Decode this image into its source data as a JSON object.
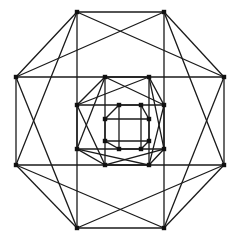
{
  "figure": {
    "kind": "line-drawing",
    "background_color": "#ffffff",
    "edge_color": "#1a1a1a",
    "vertex_color": "#111111",
    "edge_width": 1.3,
    "vertex_size": 4.4,
    "canvas": {
      "width": 233,
      "height": 241
    }
  },
  "chart_data": {
    "type": "diagram",
    "grid": false,
    "legend": null,
    "xlim": [
      0,
      233
    ],
    "ylim": [
      0,
      241
    ],
    "vertices": [
      {
        "id": "o-n-w",
        "x": 77,
        "y": 12
      },
      {
        "id": "o-n-e",
        "x": 164,
        "y": 12
      },
      {
        "id": "o-e-n",
        "x": 224,
        "y": 77
      },
      {
        "id": "o-e-s",
        "x": 224,
        "y": 165
      },
      {
        "id": "o-s-e",
        "x": 164,
        "y": 228
      },
      {
        "id": "o-s-w",
        "x": 77,
        "y": 228
      },
      {
        "id": "o-w-s",
        "x": 16,
        "y": 165
      },
      {
        "id": "o-w-n",
        "x": 16,
        "y": 77
      },
      {
        "id": "m-n-w",
        "x": 105,
        "y": 77
      },
      {
        "id": "m-n-e",
        "x": 149,
        "y": 77
      },
      {
        "id": "m-e-n",
        "x": 164,
        "y": 105
      },
      {
        "id": "m-e-s",
        "x": 164,
        "y": 149
      },
      {
        "id": "m-s-e",
        "x": 149,
        "y": 165
      },
      {
        "id": "m-s-w",
        "x": 105,
        "y": 165
      },
      {
        "id": "m-w-s",
        "x": 77,
        "y": 149
      },
      {
        "id": "m-w-n",
        "x": 77,
        "y": 105
      },
      {
        "id": "i-n-w",
        "x": 119,
        "y": 105
      },
      {
        "id": "i-n-e",
        "x": 141,
        "y": 105
      },
      {
        "id": "i-e-n",
        "x": 149,
        "y": 119
      },
      {
        "id": "i-e-s",
        "x": 149,
        "y": 141
      },
      {
        "id": "i-s-e",
        "x": 141,
        "y": 149
      },
      {
        "id": "i-s-w",
        "x": 119,
        "y": 149
      },
      {
        "id": "i-w-s",
        "x": 105,
        "y": 141
      },
      {
        "id": "i-w-n",
        "x": 105,
        "y": 119
      }
    ],
    "edges": [
      [
        "o-n-w",
        "o-n-e"
      ],
      [
        "o-n-e",
        "o-e-n"
      ],
      [
        "o-e-n",
        "o-e-s"
      ],
      [
        "o-e-s",
        "o-s-e"
      ],
      [
        "o-s-e",
        "o-s-w"
      ],
      [
        "o-s-w",
        "o-w-s"
      ],
      [
        "o-w-s",
        "o-w-n"
      ],
      [
        "o-w-n",
        "o-n-w"
      ],
      [
        "o-n-w",
        "o-s-w"
      ],
      [
        "o-n-e",
        "o-s-e"
      ],
      [
        "o-w-n",
        "o-e-n"
      ],
      [
        "o-w-s",
        "o-e-s"
      ],
      [
        "o-w-n",
        "o-n-e"
      ],
      [
        "o-n-e",
        "o-e-s"
      ],
      [
        "o-e-s",
        "o-s-w"
      ],
      [
        "o-s-w",
        "o-w-n"
      ],
      [
        "o-n-w",
        "o-e-n"
      ],
      [
        "o-e-n",
        "o-s-e"
      ],
      [
        "o-s-e",
        "o-w-s"
      ],
      [
        "o-w-s",
        "o-n-w"
      ],
      [
        "m-n-w",
        "m-n-e"
      ],
      [
        "m-n-e",
        "m-e-n"
      ],
      [
        "m-e-n",
        "m-e-s"
      ],
      [
        "m-e-s",
        "m-s-e"
      ],
      [
        "m-s-e",
        "m-s-w"
      ],
      [
        "m-s-w",
        "m-w-s"
      ],
      [
        "m-w-s",
        "m-w-n"
      ],
      [
        "m-w-n",
        "m-n-w"
      ],
      [
        "m-n-w",
        "m-s-w"
      ],
      [
        "m-n-e",
        "m-s-e"
      ],
      [
        "m-w-n",
        "m-e-n"
      ],
      [
        "m-w-s",
        "m-e-s"
      ],
      [
        "m-w-n",
        "m-n-e"
      ],
      [
        "m-n-e",
        "m-e-s"
      ],
      [
        "m-e-s",
        "m-s-w"
      ],
      [
        "m-s-w",
        "m-w-n"
      ],
      [
        "m-n-w",
        "m-e-n"
      ],
      [
        "m-e-n",
        "m-s-e"
      ],
      [
        "m-s-e",
        "m-w-s"
      ],
      [
        "m-w-s",
        "m-n-w"
      ],
      [
        "i-n-w",
        "i-n-e"
      ],
      [
        "i-n-e",
        "i-e-n"
      ],
      [
        "i-e-n",
        "i-e-s"
      ],
      [
        "i-e-s",
        "i-s-e"
      ],
      [
        "i-s-e",
        "i-s-w"
      ],
      [
        "i-s-w",
        "i-w-s"
      ],
      [
        "i-w-s",
        "i-w-n"
      ],
      [
        "i-w-n",
        "i-n-w"
      ],
      [
        "i-n-w",
        "i-s-w"
      ],
      [
        "i-n-e",
        "i-s-e"
      ],
      [
        "i-w-n",
        "i-e-n"
      ],
      [
        "i-w-s",
        "i-e-s"
      ]
    ]
  }
}
